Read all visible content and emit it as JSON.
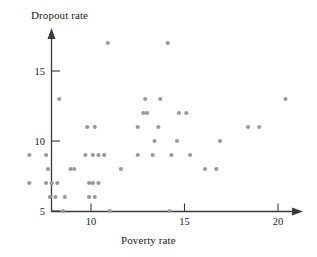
{
  "chart_data": {
    "type": "scatter",
    "title": "",
    "xlabel": "Poverty rate",
    "ylabel": "Dropout rate",
    "xlim": [
      6.2,
      21.2
    ],
    "ylim": [
      5,
      17.4
    ],
    "xticks": [
      10,
      15,
      20
    ],
    "yticks": [
      5,
      10,
      15
    ],
    "xtick_labels": [
      "10",
      "15",
      "20"
    ],
    "ytick_labels": [
      "5",
      "10",
      "15"
    ],
    "grid": false,
    "legend": null,
    "marker": {
      "shape": "circle",
      "color": "#9a9a9e",
      "size": 2.1
    },
    "axis_style": "arrowed-open-axes",
    "n_points": 64,
    "points": [
      {
        "x": 6.7,
        "y": 9.0
      },
      {
        "x": 6.7,
        "y": 7.0
      },
      {
        "x": 7.6,
        "y": 9.0
      },
      {
        "x": 7.7,
        "y": 8.0
      },
      {
        "x": 7.6,
        "y": 7.0
      },
      {
        "x": 7.9,
        "y": 7.0
      },
      {
        "x": 8.2,
        "y": 7.0
      },
      {
        "x": 7.8,
        "y": 6.0
      },
      {
        "x": 8.1,
        "y": 6.0
      },
      {
        "x": 8.6,
        "y": 6.0
      },
      {
        "x": 8.3,
        "y": 13.0
      },
      {
        "x": 8.5,
        "y": 5.0
      },
      {
        "x": 8.9,
        "y": 8.0
      },
      {
        "x": 9.1,
        "y": 8.0
      },
      {
        "x": 9.7,
        "y": 9.0
      },
      {
        "x": 9.9,
        "y": 6.0
      },
      {
        "x": 10.2,
        "y": 6.0
      },
      {
        "x": 9.9,
        "y": 7.0
      },
      {
        "x": 10.1,
        "y": 7.0
      },
      {
        "x": 10.4,
        "y": 7.0
      },
      {
        "x": 10.1,
        "y": 9.0
      },
      {
        "x": 10.4,
        "y": 9.0
      },
      {
        "x": 10.7,
        "y": 9.0
      },
      {
        "x": 9.8,
        "y": 11.0
      },
      {
        "x": 10.2,
        "y": 11.0
      },
      {
        "x": 10.9,
        "y": 17.0
      },
      {
        "x": 11.0,
        "y": 5.0
      },
      {
        "x": 11.6,
        "y": 8.0
      },
      {
        "x": 12.5,
        "y": 9.0
      },
      {
        "x": 12.5,
        "y": 11.0
      },
      {
        "x": 12.8,
        "y": 12.0
      },
      {
        "x": 13.0,
        "y": 12.0
      },
      {
        "x": 12.9,
        "y": 13.0
      },
      {
        "x": 13.3,
        "y": 9.0
      },
      {
        "x": 13.4,
        "y": 10.0
      },
      {
        "x": 13.6,
        "y": 11.0
      },
      {
        "x": 13.7,
        "y": 13.0
      },
      {
        "x": 14.1,
        "y": 17.0
      },
      {
        "x": 14.2,
        "y": 5.0
      },
      {
        "x": 14.3,
        "y": 9.0
      },
      {
        "x": 14.6,
        "y": 10.0
      },
      {
        "x": 14.7,
        "y": 12.0
      },
      {
        "x": 15.1,
        "y": 12.0
      },
      {
        "x": 15.3,
        "y": 9.0
      },
      {
        "x": 16.1,
        "y": 8.0
      },
      {
        "x": 16.7,
        "y": 8.0
      },
      {
        "x": 16.9,
        "y": 10.0
      },
      {
        "x": 18.4,
        "y": 11.0
      },
      {
        "x": 19.0,
        "y": 11.0
      },
      {
        "x": 20.4,
        "y": 13.0
      }
    ]
  }
}
